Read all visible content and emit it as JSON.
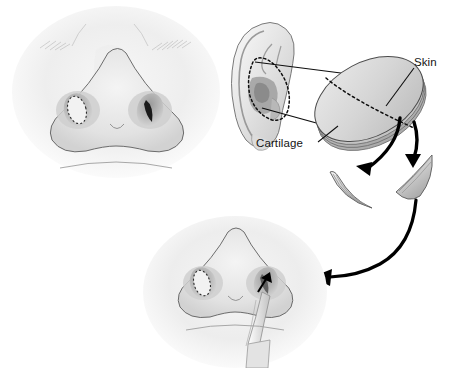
{
  "figure": {
    "background_color": "#ffffff",
    "line_color": "#111111",
    "ink_color": "#141414"
  },
  "labels": {
    "skin": "Skin",
    "cartilage": "Cartilage"
  },
  "panels": {
    "donor_ear": {
      "name": "ear-diagram",
      "harvest_site": "conchal bowl dotted outline"
    },
    "upper_nose": {
      "name": "nose-preoperative",
      "left_nostril_marking": "dotted oval graft outline",
      "right_nostril_marking": "dark alar defect"
    },
    "lower_nose": {
      "name": "nose-graft-insertion",
      "instrument": "forceps",
      "insertion_arrow": "black arrowhead into right nostril"
    },
    "composite_graft": {
      "name": "oval-composite-graft",
      "split_line": "dotted dividing line",
      "layers": [
        "Skin",
        "Cartilage"
      ]
    },
    "crescents": {
      "left": "crescent-graft-left",
      "right": "crescent-graft-right",
      "count": 2
    }
  },
  "arrows": {
    "to_left_crescent": "curved arrow from graft to left crescent",
    "to_right_crescent": "curved arrow from graft to right crescent",
    "to_nose": "long curved arrow from right crescent to lower nose"
  },
  "colors": {
    "skin_tone_light": "#f2f2f2",
    "skin_tone_mid": "#d8d8d8",
    "skin_tone_shadow": "#b4b4b4",
    "cartilage_gray": "#c9c9c9",
    "outline": "#111111",
    "defect_dark": "#1a1a1a"
  }
}
